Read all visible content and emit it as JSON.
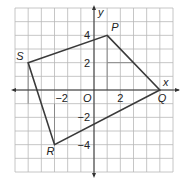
{
  "figure": {
    "type": "coordinate-plane",
    "x_range": [
      -6,
      6
    ],
    "y_range": [
      -6,
      6
    ],
    "axis_labels": {
      "x": "x",
      "y": "y"
    },
    "origin_label": "O",
    "x_tick_labels": [
      {
        "value": -2,
        "text": "−2"
      },
      {
        "value": 2,
        "text": "2"
      }
    ],
    "y_tick_labels": [
      {
        "value": 4,
        "text": "4"
      },
      {
        "value": 2,
        "text": "2"
      },
      {
        "value": -2,
        "text": "−2"
      },
      {
        "value": -4,
        "text": "−4"
      }
    ],
    "polygon": {
      "name": "PQRS",
      "vertices": [
        {
          "label": "P",
          "x": 1,
          "y": 4
        },
        {
          "label": "Q",
          "x": 5,
          "y": 0
        },
        {
          "label": "R",
          "x": -3,
          "y": -4
        },
        {
          "label": "S",
          "x": -5,
          "y": 2
        }
      ]
    },
    "helper_lines": [
      {
        "from": [
          1,
          4
        ],
        "to": [
          1,
          0
        ]
      },
      {
        "from": [
          1,
          2
        ],
        "to": [
          3,
          2
        ]
      },
      {
        "from": [
          -5,
          2
        ],
        "to": [
          -5,
          -1
        ]
      },
      {
        "from": [
          -3,
          -4
        ],
        "to": [
          -3,
          -1
        ]
      }
    ],
    "colors": {
      "grid": "#b8b8b8",
      "helper": "#8a8a8a",
      "axis": "#333333",
      "polygon": "#3a3a3a",
      "text": "#222222"
    }
  }
}
